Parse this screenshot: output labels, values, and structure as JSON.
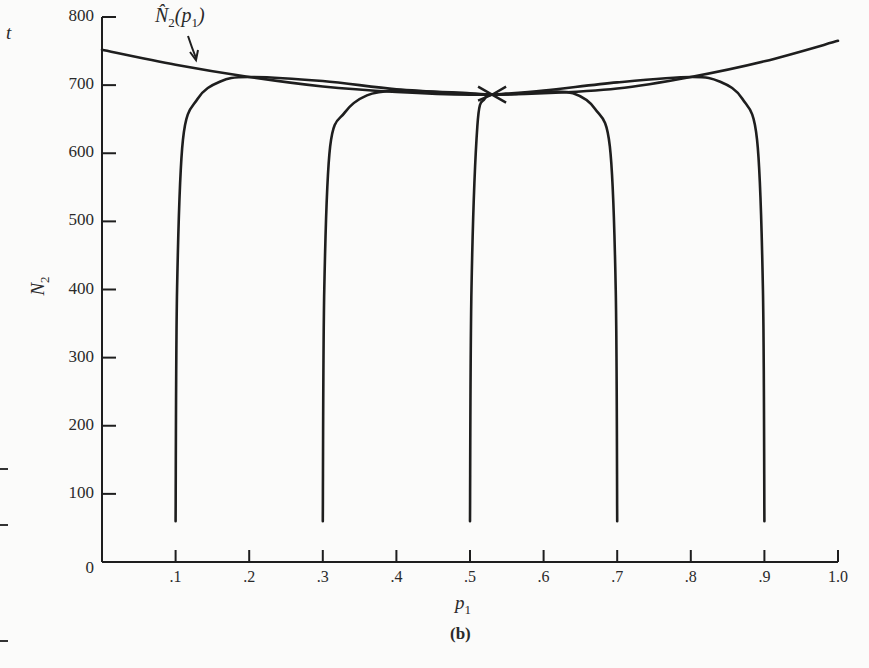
{
  "chart_data": {
    "type": "line",
    "panel_label": "(b)",
    "xlabel": "p1",
    "ylabel": "N2",
    "xlim": [
      0,
      1.0
    ],
    "ylim": [
      0,
      800
    ],
    "grid": false,
    "x_ticks": [
      ".1",
      ".2",
      ".3",
      ".4",
      ".5",
      ".6",
      ".7",
      ".8",
      ".9",
      "1.0"
    ],
    "y_ticks": [
      "0",
      "100",
      "200",
      "300",
      "400",
      "500",
      "600",
      "700",
      "800"
    ],
    "annotation": "N̂2(p1)",
    "series": [
      {
        "name": "N̂2(p1)",
        "x": [
          0.0,
          0.1,
          0.2,
          0.3,
          0.4,
          0.5,
          0.6,
          0.7,
          0.8,
          0.9,
          1.0
        ],
        "y": [
          752,
          730,
          712,
          698,
          690,
          686,
          688,
          695,
          712,
          735,
          765
        ]
      },
      {
        "name": "trajectory from p1=0.1",
        "x": [
          0.1,
          0.102,
          0.11,
          0.13,
          0.16,
          0.2,
          0.3,
          0.4,
          0.5,
          0.53
        ],
        "y": [
          60,
          400,
          620,
          680,
          705,
          712,
          706,
          694,
          688,
          686
        ]
      },
      {
        "name": "trajectory from p1=0.3",
        "x": [
          0.3,
          0.302,
          0.31,
          0.33,
          0.36,
          0.4,
          0.45,
          0.5,
          0.53
        ],
        "y": [
          60,
          400,
          610,
          660,
          685,
          692,
          690,
          687,
          686
        ]
      },
      {
        "name": "trajectory from p1=0.5",
        "x": [
          0.5,
          0.502,
          0.51,
          0.52,
          0.53
        ],
        "y": [
          60,
          400,
          640,
          680,
          686
        ]
      },
      {
        "name": "trajectory from p1=0.7",
        "x": [
          0.7,
          0.698,
          0.69,
          0.67,
          0.64,
          0.6,
          0.56,
          0.53
        ],
        "y": [
          60,
          400,
          610,
          665,
          688,
          690,
          687,
          686
        ]
      },
      {
        "name": "trajectory from p1=0.9",
        "x": [
          0.9,
          0.898,
          0.89,
          0.87,
          0.84,
          0.8,
          0.7,
          0.6,
          0.53
        ],
        "y": [
          60,
          400,
          620,
          680,
          705,
          712,
          704,
          692,
          686
        ]
      }
    ],
    "equilibrium": {
      "p1": 0.53,
      "N2": 686
    }
  },
  "labels": {
    "ylabel_main": "N",
    "ylabel_sub": "2",
    "xlabel_main": "p",
    "xlabel_sub": "1",
    "annotation_main": "N̂",
    "annotation_sub": "2",
    "annotation_arg_open": "(p",
    "annotation_arg_sub": "1",
    "annotation_arg_close": ")",
    "panel": "(b)",
    "margin_letter": "t"
  }
}
